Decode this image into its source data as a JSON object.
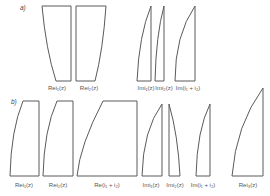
{
  "panels": [
    {
      "label": "a)",
      "shapes": [
        {
          "name": "re-i1-a",
          "label": "Rei₁(z)",
          "path": "M42,6 L71,6 L71,81 L56,81 Q46,50 42,6 Z",
          "label_x": 57
        },
        {
          "name": "re-i2-a",
          "label": "Rei₂(z)",
          "path": "M76,6 L106,6 Q103,50 95,81 L76,81 Z",
          "label_x": 89
        },
        {
          "name": "im-i1-a",
          "label": "Imi₁(z)",
          "path": "M137,81 Q139,35 151,6 L151,81 Z",
          "label_x": 146
        },
        {
          "name": "im-i2-a",
          "label": "Imi₂(z)",
          "path": "M155,81 Q156,35 164,6 L164,81 Z",
          "label_x": 162
        },
        {
          "name": "im-sum-a",
          "label": "Im(i₁ + i₂)",
          "path": "M175,81 Q175,35 195,6 L195,81 Z",
          "label_x": 188
        }
      ]
    },
    {
      "label": "b)",
      "shapes": [
        {
          "name": "re-i1-b",
          "label": "Rei₁(z)",
          "path": "M10,176 Q11,130 23,101 L39,101 L39,176 Z",
          "label_x": 24
        },
        {
          "name": "re-i2-b",
          "label": "Rei₂(z)",
          "path": "M43,176 Q44,130 57,101 L73,101 L73,176 Z",
          "label_x": 58
        },
        {
          "name": "re-sum-b",
          "label": "Re(i₁ + i₂)",
          "path": "M77,176 Q80,145 103,101 L137,101 L137,176 Z",
          "label_x": 107
        },
        {
          "name": "im-i1-b",
          "label": "Imi₁(z)",
          "path": "M142,176 Q143,130 162,104 L162,176 Z",
          "label_x": 152
        },
        {
          "name": "im-i2-b",
          "label": "Imi₂(z)",
          "path": "M169,104 Q178,135 180,176 L169,176 Z",
          "label_x": 175
        },
        {
          "name": "im-sum-b",
          "label": "Im(i₁ + i₂)",
          "path": "M196,176 Q197,130 210,104 L210,176 Z",
          "label_x": 203
        },
        {
          "name": "re-i3-b",
          "label": "Rei₃(z)",
          "path": "M232,176 Q236,125 263,88 L263,176 Z",
          "label_x": 248
        }
      ]
    }
  ]
}
